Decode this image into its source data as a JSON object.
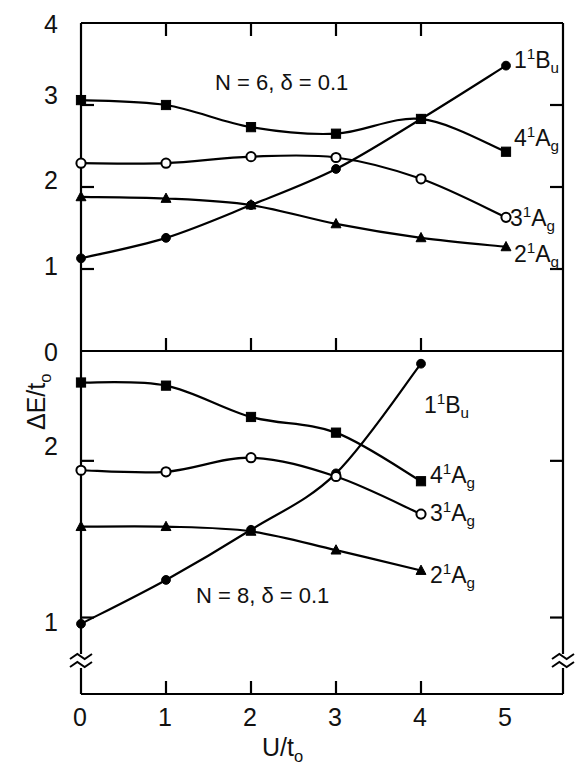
{
  "figure": {
    "xlabel_main": "U/t",
    "xlabel_sub": "o",
    "ylabel_main": "ΔE/t",
    "ylabel_sub": "o"
  },
  "axes": {
    "x_ticks": [
      "0",
      "1",
      "2",
      "3",
      "4",
      "5"
    ],
    "x_values": [
      0,
      1,
      2,
      3,
      4,
      5
    ],
    "upper_y_ticks": [
      "0",
      "1",
      "2",
      "3",
      "4"
    ],
    "upper_y_values": [
      0,
      1,
      2,
      3,
      4
    ],
    "lower_y_ticks": [
      "1",
      "2"
    ],
    "lower_y_values": [
      1,
      2
    ],
    "axis_break_symbol": "≈"
  },
  "chart_data": [
    {
      "type": "line",
      "panel": "upper",
      "title": "",
      "annotation": "N = 6,  δ = 0.1",
      "xlabel": "U/t₀",
      "ylabel": "ΔE/t₀",
      "xlim": [
        0,
        5
      ],
      "ylim": [
        0,
        4
      ],
      "grid": false,
      "x": [
        0,
        1,
        2,
        3,
        4,
        5
      ],
      "series": [
        {
          "name": "1¹Bᵤ",
          "marker": "filled-circle",
          "x": [
            0,
            1,
            2,
            3,
            4,
            5
          ],
          "values": [
            1.13,
            1.38,
            1.78,
            2.22,
            2.83,
            3.48
          ]
        },
        {
          "name": "4¹A₉",
          "marker": "filled-square",
          "x": [
            0,
            1,
            2,
            3,
            4,
            5
          ],
          "values": [
            3.06,
            3.0,
            2.73,
            2.65,
            2.83,
            2.43
          ]
        },
        {
          "name": "3¹A₉",
          "marker": "open-circle",
          "x": [
            0,
            1,
            2,
            3,
            4,
            5
          ],
          "values": [
            2.29,
            2.29,
            2.37,
            2.36,
            2.1,
            1.63
          ]
        },
        {
          "name": "2¹A₉",
          "marker": "filled-triangle",
          "x": [
            0,
            1,
            2,
            3,
            4,
            5
          ],
          "values": [
            1.88,
            1.86,
            1.78,
            1.55,
            1.38,
            1.27
          ]
        }
      ],
      "legend_position": "right-inline",
      "legend_entries": [
        "1¹Bᵤ",
        "4¹A₉",
        "3¹A₉",
        "2¹A₉"
      ]
    },
    {
      "type": "line",
      "panel": "lower",
      "title": "",
      "annotation": "N = 8,  δ = 0.1",
      "xlabel": "U/t₀",
      "ylabel": "ΔE/t₀",
      "xlim": [
        0,
        5
      ],
      "ylim": [
        0.78,
        2.65
      ],
      "grid": false,
      "axis_break": true,
      "x": [
        0,
        1,
        2,
        3,
        4
      ],
      "series": [
        {
          "name": "1¹Bᵤ",
          "marker": "filled-circle",
          "x": [
            0,
            1,
            2,
            3,
            4
          ],
          "values": [
            0.96,
            1.24,
            1.56,
            1.92,
            2.62
          ]
        },
        {
          "name": "4¹A₉",
          "marker": "filled-square",
          "x": [
            0,
            1,
            2,
            3,
            4
          ],
          "values": [
            2.5,
            2.48,
            2.28,
            2.18,
            1.87
          ]
        },
        {
          "name": "3¹A₉",
          "marker": "open-circle",
          "x": [
            0,
            1,
            2,
            3,
            4
          ],
          "values": [
            1.94,
            1.93,
            2.02,
            1.9,
            1.66
          ]
        },
        {
          "name": "2¹A₉",
          "marker": "filled-triangle",
          "x": [
            0,
            1,
            2,
            3,
            4
          ],
          "values": [
            1.58,
            1.58,
            1.55,
            1.43,
            1.3
          ]
        }
      ],
      "legend_position": "right-inline",
      "legend_entries": [
        "1¹Bᵤ",
        "4¹A₉",
        "3¹A₉",
        "2¹A₉"
      ]
    }
  ],
  "labels": {
    "upper": {
      "condition": "N = 6,  δ = 0.1",
      "s1_base": "1",
      "s1_sup": "1",
      "s1_rest": "B",
      "s1_sub": "u",
      "s2_base": "4",
      "s2_sup": "1",
      "s2_rest": "A",
      "s2_sub": "g",
      "s3_base": "3",
      "s3_sup": "1",
      "s3_rest": "A",
      "s3_sub": "g",
      "s4_base": "2",
      "s4_sup": "1",
      "s4_rest": "A",
      "s4_sub": "g"
    },
    "lower": {
      "condition": "N = 8,  δ = 0.1",
      "s1_base": "1",
      "s1_sup": "1",
      "s1_rest": "B",
      "s1_sub": "u",
      "s2_base": "4",
      "s2_sup": "1",
      "s2_rest": "A",
      "s2_sub": "g",
      "s3_base": "3",
      "s3_sup": "1",
      "s3_rest": "A",
      "s3_sub": "g",
      "s4_base": "2",
      "s4_sup": "1",
      "s4_rest": "A",
      "s4_sub": "g"
    }
  },
  "colors": {
    "line": "#000000",
    "background": "#ffffff",
    "text": "#111111"
  }
}
